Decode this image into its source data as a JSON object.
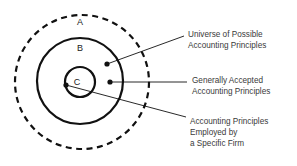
{
  "diagram": {
    "colors": {
      "stroke": "#111111",
      "text": "#3a3a3a",
      "label": "#1a1a1a",
      "background": "#ffffff"
    },
    "rings": [
      {
        "id": "A",
        "label": "A",
        "style": "dashed",
        "cx": 82,
        "cy": 82,
        "r": 67,
        "label_x": 80,
        "label_y": 25
      },
      {
        "id": "B",
        "label": "B",
        "style": "solid",
        "cx": 80,
        "cy": 81,
        "r": 43,
        "label_x": 80,
        "label_y": 51
      },
      {
        "id": "C",
        "label": "C",
        "style": "solid",
        "cx": 80,
        "cy": 82,
        "r": 15,
        "label_x": 77,
        "label_y": 85
      }
    ],
    "callouts": [
      {
        "id": "universe",
        "lines": [
          "Universe of Possible",
          "Accounting Principles"
        ],
        "dot_x": 107,
        "dot_y": 64,
        "leader_x2": 184,
        "leader_y2": 36,
        "text_x": 188,
        "text_y1": 37,
        "line_height": 11
      },
      {
        "id": "gaap",
        "lines": [
          "Generally Accepted",
          "Accounting Principles"
        ],
        "dot_x": 110,
        "dot_y": 82,
        "leader_x2": 187,
        "leader_y2": 82,
        "text_x": 192,
        "text_y1": 83,
        "line_height": 11
      },
      {
        "id": "firm",
        "lines": [
          "Accounting Principles",
          "Employed by",
          "a Specific Firm"
        ],
        "dot_x": 66,
        "dot_y": 85,
        "leader_x2": 186,
        "leader_y2": 117,
        "text_x": 190,
        "text_y1": 124,
        "line_height": 11
      }
    ]
  }
}
